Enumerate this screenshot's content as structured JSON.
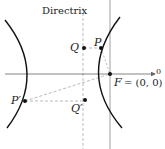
{
  "diagram": {
    "directrix_label": "Directrix",
    "points": {
      "Q": "Q",
      "P": "P",
      "P_prime": "P′",
      "Q_prime": "Q′",
      "F": "F",
      "F_coords": "= (0, 0)"
    },
    "axis_label": "0",
    "colors": {
      "curve": "#111111",
      "axis": "#666666",
      "dashed": "#aaaaaa",
      "point": "#111111"
    }
  }
}
